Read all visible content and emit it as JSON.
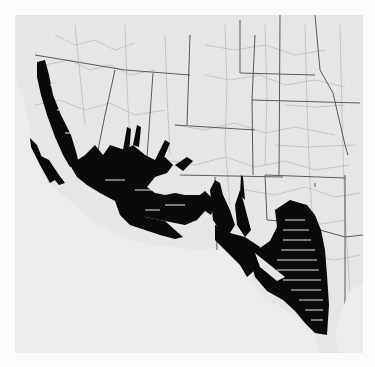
{
  "map": {
    "title": "",
    "region": "Southwestern United States",
    "style": "grayscale county outline map with shaded distribution",
    "colors": {
      "page": "#fbfbfb",
      "land": "#e6e6e6",
      "ocean": "#ececec",
      "shaded": "#0a0a0a",
      "state_lines": "#555555",
      "county_lines": "#9a9a9a"
    },
    "legend": [],
    "labels": []
  }
}
